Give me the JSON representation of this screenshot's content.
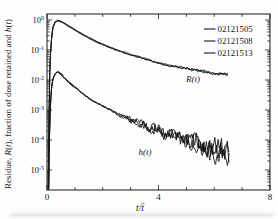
{
  "figure": {
    "background": "#fefefe",
    "ink": "#161616"
  },
  "chart_data": {
    "type": "line",
    "title": "",
    "xlabel": "t/t̄",
    "ylabel": "Residue, R(t), fraction of dose retained and h(t)",
    "xlabel_segments": [
      {
        "text": "t",
        "italic": true
      },
      {
        "text": "/",
        "italic": false
      },
      {
        "text": "t̄",
        "italic": true
      }
    ],
    "ylabel_segments": [
      {
        "text": "Residue, ",
        "italic": false
      },
      {
        "text": "R",
        "italic": true
      },
      {
        "text": "(",
        "italic": false
      },
      {
        "text": "t",
        "italic": true
      },
      {
        "text": "), fraction of dose retained and ",
        "italic": false
      },
      {
        "text": "h",
        "italic": true
      },
      {
        "text": "(",
        "italic": false
      },
      {
        "text": "t",
        "italic": true
      },
      {
        "text": ")",
        "italic": false
      }
    ],
    "x_axis": {
      "min": 0,
      "max": 8,
      "major_ticks": [
        0,
        4,
        8
      ],
      "major_tick_labels": [
        "0",
        "4",
        "8"
      ],
      "minor_ticks": [
        1,
        2,
        3,
        5,
        6,
        7
      ],
      "grid": false
    },
    "y_axis": {
      "scale": "log",
      "decade_exponents": [
        0,
        -1,
        -2,
        -3,
        -4,
        -5
      ],
      "decade_exponent_labels": [
        "0",
        "-1",
        "-2",
        "-3",
        "-4",
        "-5"
      ],
      "top_log10": 0.2,
      "bottom_log10": -5.667,
      "grid": false
    },
    "legend": {
      "position": "top-right",
      "entries": [
        "02121505",
        "02121508",
        "02121513"
      ]
    },
    "annotations": [
      {
        "label": "R(t)",
        "t": 5.24,
        "v": 0.0086
      },
      {
        "label": "h(t)",
        "t": 3.52,
        "v": 3.2e-05
      }
    ],
    "series": [
      {
        "key": "R",
        "name": "R(t)",
        "points": [
          [
            0.04,
            2e-06
          ],
          [
            0.07,
            0.0005
          ],
          [
            0.1,
            0.02
          ],
          [
            0.14,
            0.14
          ],
          [
            0.18,
            0.36
          ],
          [
            0.22,
            0.58
          ],
          [
            0.27,
            0.77
          ],
          [
            0.32,
            0.89
          ],
          [
            0.38,
            0.95
          ],
          [
            0.45,
            0.93
          ],
          [
            0.55,
            0.85
          ],
          [
            0.65,
            0.75
          ],
          [
            0.75,
            0.655
          ],
          [
            0.85,
            0.57
          ],
          [
            0.95,
            0.5
          ],
          [
            1.1,
            0.41
          ],
          [
            1.3,
            0.32
          ],
          [
            1.5,
            0.255
          ],
          [
            1.7,
            0.205
          ],
          [
            1.9,
            0.168
          ],
          [
            2.1,
            0.14
          ],
          [
            2.3,
            0.118
          ],
          [
            2.5,
            0.1
          ],
          [
            2.7,
            0.086
          ],
          [
            2.9,
            0.074
          ],
          [
            3.1,
            0.065
          ],
          [
            3.3,
            0.057
          ],
          [
            3.5,
            0.05
          ],
          [
            3.7,
            0.044
          ],
          [
            3.9,
            0.039
          ],
          [
            4.1,
            0.035
          ],
          [
            4.3,
            0.032
          ],
          [
            4.5,
            0.029
          ],
          [
            4.7,
            0.027
          ],
          [
            4.9,
            0.025
          ],
          [
            5.1,
            0.023
          ],
          [
            5.3,
            0.0215
          ],
          [
            5.5,
            0.02
          ],
          [
            5.7,
            0.019
          ],
          [
            5.9,
            0.018
          ],
          [
            6.1,
            0.017
          ],
          [
            6.3,
            0.016
          ],
          [
            6.5,
            0.015
          ]
        ]
      },
      {
        "key": "h",
        "name": "h(t)",
        "points": [
          [
            0.05,
            5e-07
          ],
          [
            0.08,
            5e-05
          ],
          [
            0.11,
            0.0008
          ],
          [
            0.15,
            0.004
          ],
          [
            0.19,
            0.0085
          ],
          [
            0.24,
            0.013
          ],
          [
            0.3,
            0.017
          ],
          [
            0.36,
            0.019
          ],
          [
            0.42,
            0.018
          ],
          [
            0.5,
            0.0155
          ],
          [
            0.6,
            0.0125
          ],
          [
            0.7,
            0.01
          ],
          [
            0.8,
            0.0082
          ],
          [
            0.9,
            0.0068
          ],
          [
            1.0,
            0.0056
          ],
          [
            1.15,
            0.0043
          ],
          [
            1.3,
            0.0034
          ],
          [
            1.5,
            0.0025
          ],
          [
            1.7,
            0.0019
          ],
          [
            1.9,
            0.0015
          ],
          [
            2.1,
            0.0012
          ],
          [
            2.3,
            0.00095
          ],
          [
            2.5,
            0.00078
          ],
          [
            2.7,
            0.00064
          ],
          [
            2.9,
            0.00053
          ],
          [
            3.1,
            0.00044
          ],
          [
            3.3,
            0.00037
          ],
          [
            3.5,
            0.00031
          ],
          [
            3.7,
            0.00026
          ],
          [
            3.9,
            0.00022
          ],
          [
            4.1,
            0.00019
          ],
          [
            4.3,
            0.00016
          ],
          [
            4.5,
            0.00014
          ],
          [
            4.7,
            0.00012
          ],
          [
            4.9,
            0.000105
          ],
          [
            5.1,
            9e-05
          ],
          [
            5.3,
            8e-05
          ],
          [
            5.5,
            7e-05
          ],
          [
            5.7,
            6e-05
          ],
          [
            5.9,
            5.2e-05
          ],
          [
            6.1,
            4.6e-05
          ],
          [
            6.3,
            4e-05
          ],
          [
            6.55,
            3.6e-05
          ]
        ]
      }
    ],
    "runs": [
      {
        "name": "02121505",
        "seed": 11,
        "offset": -0.013
      },
      {
        "name": "02121508",
        "seed": 23,
        "offset": 0.0
      },
      {
        "name": "02121513",
        "seed": 37,
        "offset": 0.014
      }
    ],
    "noise": {
      "R": {
        "base": 0.012,
        "grow": 0.05
      },
      "h": {
        "base": 0.035,
        "grow": 0.45
      },
      "grow_start": 2.2,
      "t_end": 6.5
    }
  }
}
